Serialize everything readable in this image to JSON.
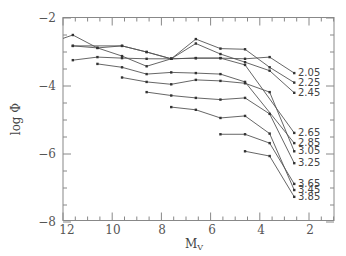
{
  "chart_data": {
    "type": "line",
    "title": "",
    "xlabel": "M_V",
    "ylabel": "log Φ",
    "xlim": [
      12,
      0.9
    ],
    "ylim": [
      -8,
      -2
    ],
    "x_reversed": true,
    "grid": false,
    "legend": "inline labels at right end of each line",
    "x_ticks": [
      "12",
      "10",
      "8",
      "6",
      "4",
      "2"
    ],
    "y_ticks": [
      "-2",
      "-4",
      "-6",
      "-8"
    ],
    "series": [
      {
        "name": "2.05",
        "points": [
          [
            11.6,
            -2.82
          ],
          [
            9.6,
            -2.82
          ],
          [
            8.6,
            -3.0
          ],
          [
            7.6,
            -3.2
          ],
          [
            6.6,
            -3.18
          ],
          [
            5.6,
            -3.18
          ],
          [
            4.6,
            -3.2
          ],
          [
            3.6,
            -3.15
          ],
          [
            2.6,
            -3.62
          ]
        ]
      },
      {
        "name": "2.25",
        "points": [
          [
            12.1,
            -2.6
          ],
          [
            11.6,
            -2.5
          ],
          [
            10.6,
            -2.88
          ],
          [
            9.6,
            -3.12
          ],
          [
            8.6,
            -3.42
          ],
          [
            7.6,
            -3.2
          ],
          [
            6.6,
            -2.62
          ],
          [
            5.6,
            -2.9
          ],
          [
            4.6,
            -2.92
          ],
          [
            3.6,
            -3.45
          ],
          [
            2.6,
            -3.9
          ]
        ]
      },
      {
        "name": "2.45",
        "points": [
          [
            11.6,
            -2.82
          ],
          [
            10.6,
            -2.88
          ],
          [
            9.6,
            -2.82
          ],
          [
            8.6,
            -3.0
          ],
          [
            7.6,
            -3.2
          ],
          [
            6.6,
            -2.75
          ],
          [
            5.6,
            -3.06
          ],
          [
            4.6,
            -3.3
          ],
          [
            3.6,
            -3.55
          ],
          [
            2.6,
            -4.2
          ]
        ]
      },
      {
        "name": "2.65",
        "points": [
          [
            11.6,
            -3.24
          ],
          [
            10.6,
            -3.15
          ],
          [
            9.6,
            -3.18
          ],
          [
            8.6,
            -3.2
          ],
          [
            7.6,
            -3.2
          ],
          [
            6.6,
            -3.18
          ],
          [
            5.6,
            -3.18
          ],
          [
            4.6,
            -3.38
          ],
          [
            2.6,
            -5.38
          ]
        ]
      },
      {
        "name": "2.85",
        "points": [
          [
            10.6,
            -3.35
          ],
          [
            9.6,
            -3.45
          ],
          [
            8.6,
            -3.65
          ],
          [
            7.6,
            -3.6
          ],
          [
            6.6,
            -3.62
          ],
          [
            5.6,
            -3.65
          ],
          [
            4.6,
            -3.88
          ],
          [
            2.6,
            -5.68
          ]
        ]
      },
      {
        "name": "3.05",
        "points": [
          [
            9.6,
            -3.75
          ],
          [
            8.6,
            -3.88
          ],
          [
            7.6,
            -3.95
          ],
          [
            6.6,
            -3.82
          ],
          [
            5.6,
            -3.85
          ],
          [
            4.6,
            -3.92
          ],
          [
            3.6,
            -4.18
          ],
          [
            2.6,
            -5.92
          ]
        ]
      },
      {
        "name": "3.25",
        "points": [
          [
            8.6,
            -4.18
          ],
          [
            7.6,
            -4.28
          ],
          [
            6.6,
            -4.35
          ],
          [
            5.6,
            -4.4
          ],
          [
            4.6,
            -4.35
          ],
          [
            3.6,
            -4.82
          ],
          [
            2.6,
            -6.27
          ]
        ]
      },
      {
        "name": "3.45",
        "points": [
          [
            7.6,
            -4.62
          ],
          [
            6.6,
            -4.7
          ],
          [
            5.6,
            -4.94
          ],
          [
            4.6,
            -4.88
          ],
          [
            3.6,
            -5.4
          ],
          [
            2.6,
            -7.06
          ]
        ]
      },
      {
        "name": "3.65",
        "points": [
          [
            5.6,
            -5.42
          ],
          [
            4.6,
            -5.42
          ],
          [
            3.6,
            -5.68
          ],
          [
            2.6,
            -6.88
          ]
        ]
      },
      {
        "name": "3.85",
        "points": [
          [
            4.6,
            -5.92
          ],
          [
            3.6,
            -6.06
          ],
          [
            2.6,
            -7.26
          ]
        ]
      }
    ],
    "series_labels": [
      "2.05",
      "2.25",
      "2.45",
      "2.65",
      "2.85",
      "3.05",
      "3.25",
      "3.65",
      "3.45",
      "3.85"
    ]
  },
  "axes": {
    "xlabel_main": "M",
    "xlabel_sub": "V",
    "ylabel": "log Φ",
    "x_ticks": [
      {
        "label": "12",
        "value": 12
      },
      {
        "label": "10",
        "value": 10
      },
      {
        "label": "8",
        "value": 8
      },
      {
        "label": "6",
        "value": 6
      },
      {
        "label": "4",
        "value": 4
      },
      {
        "label": "2",
        "value": 2
      }
    ],
    "y_ticks": [
      {
        "label": "−2",
        "value": -2
      },
      {
        "label": "−4",
        "value": -4
      },
      {
        "label": "−6",
        "value": -6
      },
      {
        "label": "−8",
        "value": -8
      }
    ]
  },
  "labels": {
    "l205": "2.05",
    "l225": "2.25",
    "l245": "2.45",
    "l265": "2.65",
    "l285": "2.85",
    "l305": "3.05",
    "l325": "3.25",
    "l365": "3.65",
    "l345": "3.45",
    "l385": "3.85"
  },
  "colors": {
    "line": "#555555",
    "axis": "#777777",
    "text": "#555555"
  }
}
